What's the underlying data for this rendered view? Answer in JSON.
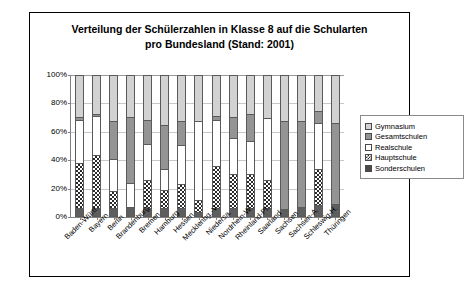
{
  "chart_data": {
    "type": "bar",
    "title": "Verteilung der Schülerzahlen in Klasse 8 auf die Schularten pro Bundesland (Stand: 2001)",
    "title_line1": "Verteilung der Schülerzahlen in Klasse 8 auf die Schularten",
    "title_line2": "pro Bundesland (Stand: 2001)",
    "subtitle": "",
    "xlabel": "",
    "ylabel": "",
    "stacked": true,
    "stack_order_bottom_to_top": [
      "Sonderschulen",
      "Hauptschule",
      "Realschule",
      "Gesamtschulen",
      "Gymnasium"
    ],
    "ylim": [
      0,
      100
    ],
    "ytick_labels": [
      "0%",
      "20%",
      "40%",
      "60%",
      "80%",
      "100%"
    ],
    "ytick_values": [
      0,
      20,
      40,
      60,
      80,
      100
    ],
    "grid": true,
    "legend_position": "right",
    "categories": [
      "Baden-Württ.",
      "Bayern",
      "Berlin",
      "Brandenburg",
      "Bremen",
      "Hamburg",
      "Hessen",
      "Mecklenbg.-V.",
      "Niedersa.",
      "Nordrhein-W.",
      "Rheinland-Pf.",
      "Saarland",
      "Sachsen",
      "Sachsen-A.",
      "Schleswig-H.",
      "Thüringen"
    ],
    "series": [
      {
        "name": "Sonderschulen",
        "color": "#5e5e5e",
        "pattern": "solid-dark-grey",
        "values": [
          5,
          5,
          5,
          6,
          5,
          5,
          5,
          2,
          5,
          5,
          5,
          5,
          4,
          6,
          7,
          8
        ]
      },
      {
        "name": "Hauptschule",
        "color": "#ffffff",
        "pattern": "checkerboard",
        "values": [
          32,
          38,
          12,
          0,
          20,
          13,
          17,
          9,
          30,
          24,
          24,
          20,
          0,
          0,
          26,
          0
        ]
      },
      {
        "name": "Realschule",
        "color": "#ffffff",
        "pattern": "white",
        "values": [
          31,
          28,
          23,
          17,
          26,
          15,
          28,
          56,
          33,
          26,
          24,
          44,
          0,
          0,
          33,
          0
        ]
      },
      {
        "name": "Gesamtschulen",
        "color": "#949494",
        "pattern": "medium-grey",
        "values": [
          2,
          1,
          27,
          47,
          17,
          31,
          17,
          0,
          3,
          15,
          19,
          0,
          63,
          61,
          8,
          58
        ]
      },
      {
        "name": "Gymnasium",
        "color": "#d2d2d2",
        "pattern": "light-grey",
        "values": [
          30,
          28,
          33,
          30,
          32,
          36,
          33,
          33,
          29,
          30,
          28,
          31,
          33,
          33,
          26,
          34
        ]
      }
    ],
    "cumulative_tops": [
      [
        5,
        37,
        68,
        70,
        100
      ],
      [
        5,
        43,
        71,
        72,
        100
      ],
      [
        5,
        17,
        40,
        67,
        100
      ],
      [
        6,
        6,
        23,
        70,
        100
      ],
      [
        5,
        25,
        51,
        68,
        100
      ],
      [
        5,
        18,
        33,
        64,
        100
      ],
      [
        5,
        22,
        50,
        67,
        100
      ],
      [
        2,
        11,
        67,
        67,
        100
      ],
      [
        5,
        35,
        68,
        71,
        100
      ],
      [
        5,
        29,
        55,
        70,
        100
      ],
      [
        5,
        29,
        53,
        72,
        100
      ],
      [
        5,
        25,
        69,
        69,
        100
      ],
      [
        4,
        4,
        4,
        67,
        100
      ],
      [
        6,
        6,
        6,
        67,
        100
      ],
      [
        7,
        33,
        66,
        74,
        100
      ],
      [
        8,
        8,
        8,
        66,
        100
      ]
    ]
  },
  "legend": {
    "items": [
      {
        "label": "Gymnasium",
        "swatch": "gym"
      },
      {
        "label": "Gesamtschulen",
        "swatch": "gesamt"
      },
      {
        "label": "Realschule",
        "swatch": "real"
      },
      {
        "label": "Hauptschule",
        "swatch": "haupt"
      },
      {
        "label": "Sonderschulen",
        "swatch": "sonder"
      }
    ]
  }
}
